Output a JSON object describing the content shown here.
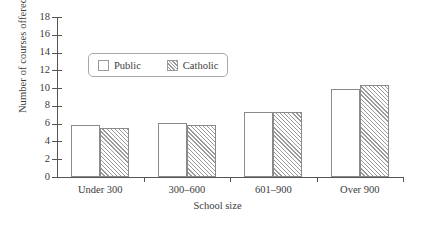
{
  "chart_data": {
    "type": "bar",
    "title": "",
    "subtitle": "",
    "xlabel": "School size",
    "ylabel": "Number of courses offered",
    "categories": [
      "Under 300",
      "300–600",
      "601–900",
      "Over 900"
    ],
    "series": [
      {
        "name": "Public",
        "values": [
          5.8,
          6.1,
          7.3,
          9.9
        ]
      },
      {
        "name": "Catholic",
        "values": [
          5.5,
          5.9,
          7.3,
          10.3
        ]
      }
    ],
    "ylim": [
      0,
      18
    ],
    "yticks": [
      0,
      2,
      4,
      6,
      8,
      10,
      12,
      14,
      16,
      18
    ],
    "ytick_labels": [
      "0",
      "2",
      "4",
      "6",
      "8",
      "10",
      "12",
      "14",
      "16",
      "18"
    ],
    "grid": false,
    "legend": {
      "position": "upper-left-inside",
      "entries": [
        {
          "label": "Public",
          "swatch": "empty-box-icon"
        },
        {
          "label": "Catholic",
          "swatch": "hatched-box-icon"
        }
      ]
    },
    "colors": {
      "public_fill": "#ffffff",
      "catholic_fill": "#ffffff",
      "catholic_hatch": "#9a9a9a",
      "bar_outline": "#8a8a8a",
      "axis": "#555555",
      "text": "#3b3b3b"
    }
  }
}
